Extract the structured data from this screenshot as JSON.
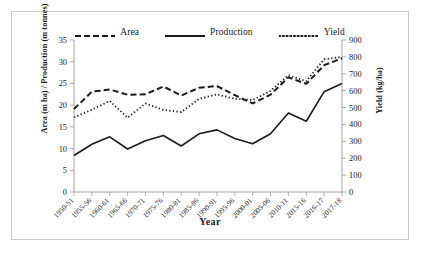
{
  "figure": {
    "border_color": "#c8c8c8",
    "background": "#ffffff"
  },
  "legend": {
    "items": [
      {
        "label": "Area",
        "style": "dashed",
        "icon": "dashed-line-swatch"
      },
      {
        "label": "Production",
        "style": "solid",
        "icon": "solid-line-swatch"
      },
      {
        "label": "Yield",
        "style": "dotted",
        "icon": "dotted-line-swatch"
      }
    ]
  },
  "axes": {
    "left_title": "Area (m ha) / Production (m tonnes)",
    "right_title": "Yield (kg/ha)",
    "x_title": "Year",
    "left_ticks": [
      "0",
      "5",
      "10",
      "15",
      "20",
      "25",
      "30",
      "35"
    ],
    "right_ticks": [
      "0",
      "100",
      "200",
      "300",
      "400",
      "500",
      "600",
      "700",
      "800",
      "900"
    ]
  },
  "chart_data": {
    "type": "line",
    "title": "",
    "xlabel": "Year",
    "ylabel": "Area (m ha) / Production (m tonnes)",
    "y2label": "Yield (kg/ha)",
    "ylim": [
      0,
      35
    ],
    "y2lim": [
      0,
      900
    ],
    "grid": false,
    "legend_position": "top-center",
    "categories": [
      "1950-51",
      "1955-56",
      "1960-61",
      "1965-66",
      "1970-71",
      "1975-76",
      "1980-81",
      "1985-86",
      "1990-91",
      "1995-96",
      "2000-01",
      "2005-06",
      "2010-11",
      "2015-16",
      "2016-17",
      "2017-18"
    ],
    "series": [
      {
        "name": "Area",
        "axis": "left",
        "unit": "m ha",
        "style": "dashed",
        "values": [
          19.1,
          23.1,
          23.6,
          22.4,
          22.5,
          24.3,
          22.2,
          24.0,
          24.4,
          22.3,
          20.4,
          22.4,
          26.4,
          24.9,
          29.2,
          30.8
        ]
      },
      {
        "name": "Production",
        "axis": "left",
        "unit": "m tonnes",
        "style": "solid",
        "values": [
          8.4,
          11.0,
          12.7,
          9.9,
          11.8,
          13.0,
          10.6,
          13.4,
          14.3,
          12.3,
          11.1,
          13.4,
          18.2,
          16.3,
          23.1,
          25.0
        ]
      },
      {
        "name": "Yield",
        "axis": "right",
        "unit": "kg/ha",
        "style": "dotted",
        "values": [
          441,
          487,
          539,
          440,
          524,
          486,
          473,
          552,
          578,
          552,
          544,
          598,
          691,
          656,
          786,
          800
        ]
      }
    ]
  }
}
